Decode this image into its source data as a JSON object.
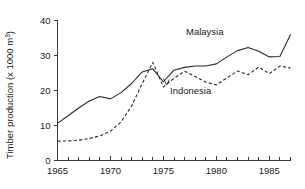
{
  "chart_data": {
    "type": "line",
    "title": "",
    "xlabel": "",
    "ylabel": "Timber production (x 1000 m³)",
    "ylabel_main": "Timber production (x 1000 m",
    "ylabel_sup": "3",
    "ylabel_tail": ")",
    "xlim": [
      1965,
      1987
    ],
    "ylim": [
      0,
      40
    ],
    "grid": false,
    "legend_position": "inline-annotation",
    "x_tick_labels": [
      "1965",
      "1970",
      "1975",
      "1980",
      "1985"
    ],
    "x_tick_values": [
      1965,
      1970,
      1975,
      1980,
      1985
    ],
    "x_minor_ticks": [
      1966,
      1967,
      1968,
      1969,
      1971,
      1972,
      1973,
      1974,
      1976,
      1977,
      1978,
      1979,
      1981,
      1982,
      1983,
      1984,
      1986,
      1987
    ],
    "y_tick_labels": [
      "0",
      "10",
      "20",
      "30",
      "40"
    ],
    "y_tick_values": [
      0,
      10,
      20,
      30,
      40
    ],
    "x": [
      1965,
      1966,
      1967,
      1968,
      1969,
      1970,
      1971,
      1972,
      1973,
      1974,
      1975,
      1976,
      1977,
      1978,
      1979,
      1980,
      1981,
      1982,
      1983,
      1984,
      1985,
      1986,
      1987
    ],
    "series": [
      {
        "name": "Malaysia",
        "style": "solid",
        "color": "#2b2b2b",
        "annotation": "Malaysia",
        "values": [
          10.6,
          12.8,
          15.0,
          17.0,
          18.3,
          17.6,
          19.4,
          22.0,
          25.3,
          26.2,
          22.5,
          25.8,
          26.6,
          27.0,
          27.0,
          27.6,
          29.6,
          31.4,
          32.3,
          31.2,
          29.6,
          29.7,
          36.0
        ]
      },
      {
        "name": "Indonesia",
        "style": "dashed",
        "color": "#2b2b2b",
        "annotation": "Indonesia",
        "values": [
          5.5,
          5.6,
          5.8,
          6.3,
          7.0,
          8.4,
          11.0,
          15.6,
          22.0,
          28.0,
          21.0,
          23.5,
          25.5,
          24.0,
          22.4,
          21.6,
          23.6,
          25.6,
          24.5,
          26.7,
          24.8,
          27.0,
          26.4
        ]
      }
    ]
  },
  "annotations": {
    "malaysia_label": "Malaysia",
    "indonesia_label": "Indonesia"
  }
}
